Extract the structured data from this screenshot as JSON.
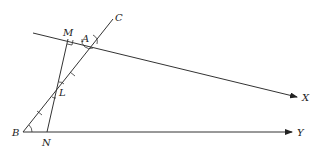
{
  "diagram": {
    "type": "geometry",
    "points": {
      "M": {
        "label": "M"
      },
      "A": {
        "label": "A"
      },
      "C": {
        "label": "C"
      },
      "L": {
        "label": "L"
      },
      "B": {
        "label": "B"
      },
      "N": {
        "label": "N"
      },
      "X": {
        "label": "X"
      },
      "Y": {
        "label": "Y"
      }
    },
    "segments": [
      "ray AX (through M)",
      "line BC (through L, A)",
      "ray BY (through N)",
      "segment MN (through L)"
    ],
    "markings": {
      "right_angle_at": "M",
      "equal_angle_arcs": [
        "A",
        "B"
      ],
      "tick_marks": [
        "AL",
        "LB"
      ],
      "equal_angles_at_L": true
    },
    "colors": {
      "line": "#333333",
      "background": "#ffffff"
    }
  }
}
